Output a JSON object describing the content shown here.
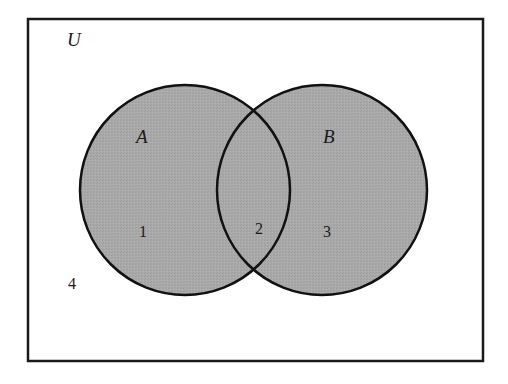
{
  "diagram": {
    "type": "venn",
    "universe": {
      "label": "U",
      "x": 28,
      "y": 19,
      "width": 455,
      "height": 342,
      "stroke": "#1a1a1a",
      "fill": "#ffffff"
    },
    "sets": [
      {
        "label": "A",
        "cx": 185,
        "cy": 190,
        "r": 105,
        "fill": "#a9a9a9",
        "stroke": "#111111"
      },
      {
        "label": "B",
        "cx": 322,
        "cy": 190,
        "r": 105,
        "fill": "#a9a9a9",
        "stroke": "#111111"
      }
    ],
    "regions": [
      {
        "label": "1",
        "description": "A only"
      },
      {
        "label": "2",
        "description": "A and B"
      },
      {
        "label": "3",
        "description": "B only"
      },
      {
        "label": "4",
        "description": "outside A and B"
      }
    ]
  }
}
